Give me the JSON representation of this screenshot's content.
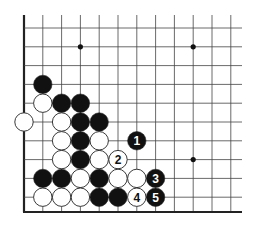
{
  "diagram": {
    "grid": {
      "cols": 12,
      "rows": 10,
      "origin_x": 24,
      "origin_y": 28,
      "spacing": 18.8,
      "top_extent_y": 15,
      "bottom_edge_y": 212,
      "right_extent_x": 242,
      "line_color": "#444444",
      "edge_color": "#222222"
    },
    "star_points": [
      {
        "col": 3,
        "row": 1
      },
      {
        "col": 9,
        "row": 1
      },
      {
        "col": 9,
        "row": 7
      }
    ],
    "stones": [
      {
        "color": "black",
        "col": 1,
        "row": 3,
        "label": ""
      },
      {
        "color": "white",
        "col": 1,
        "row": 4,
        "label": ""
      },
      {
        "color": "black",
        "col": 2,
        "row": 4,
        "label": ""
      },
      {
        "color": "black",
        "col": 3,
        "row": 4,
        "label": ""
      },
      {
        "color": "white",
        "col": 0,
        "row": 5,
        "label": ""
      },
      {
        "color": "white",
        "col": 2,
        "row": 5,
        "label": ""
      },
      {
        "color": "black",
        "col": 3,
        "row": 5,
        "label": ""
      },
      {
        "color": "black",
        "col": 4,
        "row": 5,
        "label": ""
      },
      {
        "color": "white",
        "col": 2,
        "row": 6,
        "label": ""
      },
      {
        "color": "black",
        "col": 3,
        "row": 6,
        "label": ""
      },
      {
        "color": "white",
        "col": 4,
        "row": 6,
        "label": ""
      },
      {
        "color": "black",
        "col": 6,
        "row": 6,
        "label": "1"
      },
      {
        "color": "white",
        "col": 2,
        "row": 7,
        "label": ""
      },
      {
        "color": "black",
        "col": 3,
        "row": 7,
        "label": ""
      },
      {
        "color": "white",
        "col": 4,
        "row": 7,
        "label": ""
      },
      {
        "color": "white",
        "col": 5,
        "row": 7,
        "label": "2"
      },
      {
        "color": "black",
        "col": 1,
        "row": 8,
        "label": ""
      },
      {
        "color": "black",
        "col": 2,
        "row": 8,
        "label": ""
      },
      {
        "color": "white",
        "col": 3,
        "row": 8,
        "label": ""
      },
      {
        "color": "black",
        "col": 4,
        "row": 8,
        "label": ""
      },
      {
        "color": "white",
        "col": 5,
        "row": 8,
        "label": ""
      },
      {
        "color": "white",
        "col": 6,
        "row": 8,
        "label": ""
      },
      {
        "color": "black",
        "col": 7,
        "row": 8,
        "label": "3"
      },
      {
        "color": "white",
        "col": 1,
        "row": 9,
        "label": ""
      },
      {
        "color": "white",
        "col": 2,
        "row": 9,
        "label": ""
      },
      {
        "color": "white",
        "col": 3,
        "row": 9,
        "label": ""
      },
      {
        "color": "black",
        "col": 4,
        "row": 9,
        "label": ""
      },
      {
        "color": "black",
        "col": 5,
        "row": 9,
        "label": ""
      },
      {
        "color": "white",
        "col": 6,
        "row": 9,
        "label": "4"
      },
      {
        "color": "black",
        "col": 7,
        "row": 9,
        "label": "5"
      }
    ],
    "colors": {
      "black_stone": "#111111",
      "white_stone": "#ffffff",
      "stone_outline": "#222222",
      "star_point": "#111111"
    }
  }
}
